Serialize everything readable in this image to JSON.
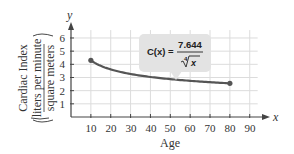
{
  "chart_data": {
    "type": "line",
    "title": "",
    "xlabel": "Age",
    "ylabel": "Cardiac Index (liters per minute / square meters)",
    "ylabel_lines": [
      "Cardiac Index",
      "liters per minute",
      "square meters"
    ],
    "x_axis_var": "x",
    "y_axis_var": "y",
    "x_ticks": [
      10,
      20,
      30,
      40,
      50,
      60,
      70,
      80,
      90
    ],
    "y_ticks": [
      1,
      2,
      3,
      4,
      5,
      6
    ],
    "xlim": [
      0,
      100
    ],
    "ylim": [
      0,
      7
    ],
    "grid": true,
    "legend": null,
    "series": [
      {
        "name": "C(x) = 7.644 / x^(1/4)",
        "x": [
          10,
          20,
          30,
          40,
          50,
          60,
          70,
          80
        ],
        "values": [
          4.3,
          3.61,
          3.27,
          3.04,
          2.87,
          2.75,
          2.64,
          2.56
        ],
        "endpoints": [
          [
            10,
            4.3
          ],
          [
            80,
            2.56
          ]
        ]
      }
    ],
    "annotations": [
      {
        "text": "C(x) = 7.644 / ∜x",
        "lhs": "C(x) =",
        "numerator": "7.644",
        "radical_index": "4",
        "radicand": "x",
        "position": "callout above curve near x=40–60"
      }
    ],
    "colors": {
      "curve": "#555555",
      "grid": "#dcdcdc",
      "axis": "#444444",
      "bubble": "#e3e3e3"
    }
  },
  "labels": {
    "x_title": "Age",
    "y_title_line1": "Cardiac Index",
    "y_title_line2": "liters per minute",
    "y_title_line3": "square meters",
    "x_var": "x",
    "y_var": "y",
    "formula_lhs": "C(x) =",
    "formula_num": "7.644",
    "formula_index": "4",
    "formula_radicand": "x",
    "x_tick_0": "10",
    "x_tick_1": "20",
    "x_tick_2": "30",
    "x_tick_3": "40",
    "x_tick_4": "50",
    "x_tick_5": "60",
    "x_tick_6": "70",
    "x_tick_7": "80",
    "x_tick_8": "90",
    "y_tick_0": "1",
    "y_tick_1": "2",
    "y_tick_2": "3",
    "y_tick_3": "4",
    "y_tick_4": "5",
    "y_tick_5": "6"
  }
}
